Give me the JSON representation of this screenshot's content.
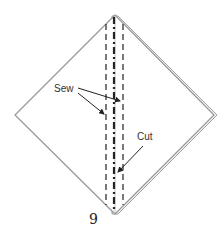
{
  "diagram": {
    "type": "folding-instruction",
    "step_number": "9",
    "labels": {
      "sew": "Sew",
      "cut": "Cut"
    },
    "colors": {
      "outline": "#9a9a9a",
      "line": "#222222",
      "background": "#ffffff"
    }
  }
}
